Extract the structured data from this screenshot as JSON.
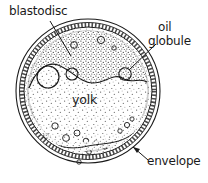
{
  "figure": {
    "background_color": "#ffffff",
    "ink_color": "#1a1a1a",
    "stipple_color": "#4a4a4a"
  },
  "labels": {
    "blastodisc": "blastodisc",
    "oil_line1": "oil",
    "oil_line2": "globule",
    "yolk": "yolk",
    "envelope": "envelope"
  },
  "structures": [
    {
      "name": "envelope",
      "description": "outer hatched multi-layered ring"
    },
    {
      "name": "blastodisc",
      "description": "densely stippled cap at top of yolk"
    },
    {
      "name": "yolk",
      "description": "lightly stippled central mass"
    },
    {
      "name": "oil-globule",
      "description": "open circles within yolk"
    }
  ],
  "geometry": {
    "egg_center_x": 88,
    "egg_center_y": 91,
    "egg_outer_radius": 72
  }
}
